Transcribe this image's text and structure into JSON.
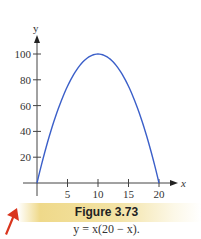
{
  "chart_data": {
    "type": "line",
    "title": "Figure 3.73",
    "subtitle": "y = x(20 − x).",
    "xlabel": "x",
    "ylabel": "y",
    "xlim": [
      0,
      21
    ],
    "ylim": [
      0,
      105
    ],
    "grid": false,
    "x_ticks": [
      5,
      10,
      15,
      20
    ],
    "y_ticks": [
      20,
      40,
      60,
      80,
      100
    ],
    "series": [
      {
        "name": "y = x(20 − x)",
        "color": "#3b5fc9",
        "x": [
          0,
          1,
          2,
          3,
          4,
          5,
          6,
          7,
          8,
          9,
          10,
          11,
          12,
          13,
          14,
          15,
          16,
          17,
          18,
          19,
          20
        ],
        "y": [
          0,
          19,
          36,
          51,
          64,
          75,
          84,
          91,
          96,
          99,
          100,
          99,
          96,
          91,
          84,
          75,
          64,
          51,
          36,
          19,
          0
        ]
      }
    ]
  },
  "caption": {
    "figure_label": "Figure 3.73",
    "formula": "y = x(20 − x).",
    "bar_color": "#efd98a"
  },
  "decoration": {
    "arrow_color": "#d9351e"
  },
  "axis": {
    "color": "#444444"
  }
}
